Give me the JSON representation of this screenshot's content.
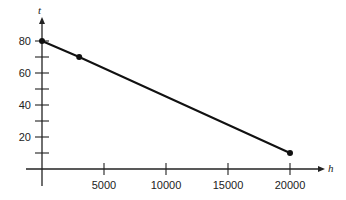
{
  "chart_data": {
    "type": "line",
    "title": "",
    "xlabel": "h",
    "ylabel": "t",
    "x": [
      0,
      3000,
      20000
    ],
    "series": [
      {
        "name": "t",
        "values": [
          80,
          70,
          10
        ]
      }
    ],
    "xlim": [
      0,
      21000
    ],
    "ylim": [
      0,
      90
    ],
    "x_ticks": [
      5000,
      10000,
      15000,
      20000
    ],
    "x_tick_labels": [
      "5000",
      "10000",
      "15000",
      "20000"
    ],
    "y_ticks": [
      20,
      40,
      60,
      80
    ],
    "y_tick_labels": [
      "20",
      "40",
      "60",
      "80"
    ],
    "y_minor_ticks": [
      10,
      30,
      50,
      70
    ],
    "grid": false,
    "legend": "none",
    "colors": {
      "line": "#111111",
      "axis": "#222222"
    }
  }
}
